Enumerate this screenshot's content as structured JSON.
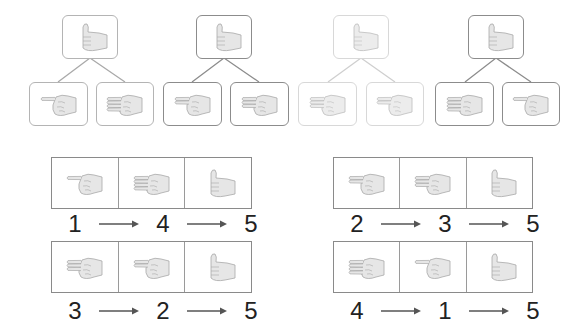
{
  "colors": {
    "border_dark": "#8c8c8c",
    "border_mid": "#b4b4b4",
    "border_light": "#d8d8d8",
    "hand_fill": "#e6e6e6",
    "hand_stroke": "#a8a8a8",
    "text": "#222222"
  },
  "trees": [
    {
      "top": "five",
      "children": [
        "one",
        "four"
      ],
      "shade": "mid"
    },
    {
      "top": "five",
      "children": [
        "two",
        "three"
      ],
      "shade": "dark"
    },
    {
      "top": "five",
      "children": [
        "three",
        "two"
      ],
      "shade": "light"
    },
    {
      "top": "five",
      "children": [
        "four",
        "one"
      ],
      "shade": "dark"
    }
  ],
  "sequences": [
    {
      "hands": [
        "one",
        "four",
        "five"
      ],
      "labels": [
        "1",
        "4",
        "5"
      ]
    },
    {
      "hands": [
        "two",
        "three",
        "five"
      ],
      "labels": [
        "2",
        "3",
        "5"
      ]
    },
    {
      "hands": [
        "three",
        "two",
        "five"
      ],
      "labels": [
        "3",
        "2",
        "5"
      ]
    },
    {
      "hands": [
        "four",
        "one",
        "five"
      ],
      "labels": [
        "4",
        "1",
        "5"
      ]
    }
  ],
  "hand_legend": {
    "one": "index finger pointing",
    "two": "two fingers extended",
    "three": "three fingers extended",
    "four": "four fingers extended",
    "five": "thumbs up"
  }
}
